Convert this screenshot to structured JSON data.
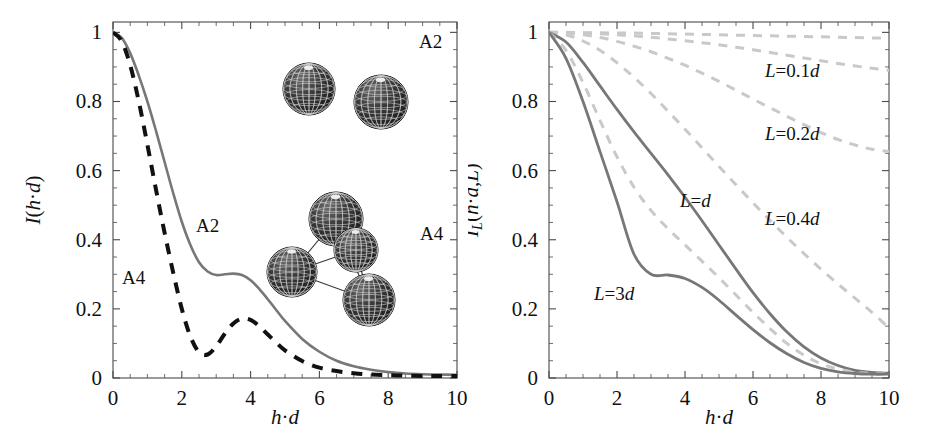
{
  "figure": {
    "background": "#ffffff",
    "panels": [
      {
        "id": "left",
        "axes": {
          "xlabel": "h·d",
          "ylabel": "I(h·d)",
          "ylabel_sub": "",
          "xticks": [
            "0",
            "2",
            "4",
            "6",
            "8",
            "10"
          ],
          "xtick_values": [
            0,
            2,
            4,
            6,
            8,
            10
          ],
          "yticks": [
            "0",
            "0.2",
            "0.4",
            "0.6",
            "0.8",
            "1"
          ],
          "ytick_values": [
            0,
            0.2,
            0.4,
            0.6,
            0.8,
            1
          ],
          "xlim": [
            0,
            10
          ],
          "ylim": [
            0,
            1.03
          ],
          "grid": false,
          "minor_ticks": true
        },
        "annotations": [
          {
            "name": "label-a2-curve",
            "text": "A2",
            "x": 196,
            "y": 232
          },
          {
            "name": "label-a4-curve",
            "text": "A4",
            "x": 122,
            "y": 284
          },
          {
            "name": "label-a2-cluster",
            "text": "A2",
            "x": 419,
            "y": 48
          },
          {
            "name": "label-a4-cluster",
            "text": "A4",
            "x": 420,
            "y": 240
          }
        ],
        "clusters": [
          {
            "name": "cluster-a2-dimer",
            "spheres": [
              [
                309,
                89,
                26
              ],
              [
                381,
                102,
                27
              ]
            ],
            "bonds": []
          },
          {
            "name": "cluster-a4-tetramer",
            "spheres": [
              [
                336,
                219,
                27
              ],
              [
                356,
                250,
                22
              ],
              [
                292,
                272,
                25
              ],
              [
                369,
                300,
                26
              ]
            ],
            "bonds": [
              [
                0,
                1
              ],
              [
                0,
                2
              ],
              [
                1,
                2
              ],
              [
                1,
                3
              ],
              [
                2,
                3
              ],
              [
                0,
                3
              ]
            ]
          }
        ]
      },
      {
        "id": "right",
        "axes": {
          "xlabel": "h·d",
          "ylabel": "I",
          "ylabel_sub": "L",
          "ylabel_rest": "(h·d,L)",
          "xticks": [
            "0",
            "2",
            "4",
            "6",
            "8",
            "10"
          ],
          "xtick_values": [
            0,
            2,
            4,
            6,
            8,
            10
          ],
          "yticks": [
            "0",
            "0.2",
            "0.4",
            "0.6",
            "0.8",
            "1"
          ],
          "ytick_values": [
            0,
            0.2,
            0.4,
            0.6,
            0.8,
            1
          ],
          "xlim": [
            0,
            10
          ],
          "ylim": [
            0,
            1.03
          ],
          "grid": false,
          "minor_ticks": true
        },
        "annotations": [
          {
            "name": "label-L-0p1d",
            "text": "L=0.1d",
            "x": 297,
            "y": 77
          },
          {
            "name": "label-L-0p2d",
            "text": "L=0.2d",
            "x": 297,
            "y": 140
          },
          {
            "name": "label-L-0p4d",
            "text": "L=0.4d",
            "x": 297,
            "y": 225
          },
          {
            "name": "label-L-d",
            "text": "L=d",
            "x": 212,
            "y": 207
          },
          {
            "name": "label-L-3d",
            "text": "L=3d",
            "x": 126,
            "y": 300
          }
        ]
      }
    ]
  },
  "colors": {
    "solid_gray": "#777777",
    "dashed_black": "#111111",
    "dashed_light": "#c9c9c9",
    "axis": "#4a4a4a",
    "text": "#111111",
    "sphere_dark": "#2b2b2b",
    "sphere_mesh": "#d8d8d8"
  },
  "chart_data": [
    {
      "type": "line",
      "panel": "left",
      "title": "",
      "xlabel": "h·d",
      "ylabel": "I(h·d)",
      "xlim": [
        0,
        10
      ],
      "ylim": [
        0,
        1.03
      ],
      "grid": false,
      "legend": "inline-labels",
      "x": [
        0,
        0.25,
        0.5,
        0.75,
        1,
        1.25,
        1.5,
        1.75,
        2,
        2.25,
        2.5,
        2.75,
        3,
        3.25,
        3.5,
        3.75,
        4,
        4.25,
        4.5,
        4.75,
        5,
        5.5,
        6,
        6.5,
        7,
        7.5,
        8,
        8.5,
        9,
        9.5,
        10
      ],
      "series": [
        {
          "name": "A2",
          "style": "solid",
          "color": "#777777",
          "values": [
            1.0,
            0.985,
            0.94,
            0.875,
            0.8,
            0.715,
            0.625,
            0.535,
            0.452,
            0.385,
            0.335,
            0.308,
            0.298,
            0.3,
            0.302,
            0.298,
            0.283,
            0.258,
            0.228,
            0.196,
            0.165,
            0.113,
            0.076,
            0.05,
            0.034,
            0.024,
            0.017,
            0.013,
            0.011,
            0.01,
            0.009
          ]
        },
        {
          "name": "A4",
          "style": "dashed",
          "color": "#111111",
          "values": [
            1.0,
            0.975,
            0.905,
            0.8,
            0.675,
            0.545,
            0.42,
            0.305,
            0.2,
            0.12,
            0.075,
            0.068,
            0.092,
            0.128,
            0.158,
            0.172,
            0.168,
            0.15,
            0.126,
            0.102,
            0.08,
            0.049,
            0.03,
            0.02,
            0.014,
            0.01,
            0.008,
            0.007,
            0.006,
            0.006,
            0.006
          ]
        }
      ]
    },
    {
      "type": "line",
      "panel": "right",
      "title": "",
      "xlabel": "h·d",
      "ylabel": "I_L(h·d,L)",
      "xlim": [
        0,
        10
      ],
      "ylim": [
        0,
        1.03
      ],
      "grid": false,
      "legend": "inline-labels",
      "x": [
        0,
        0.5,
        1,
        1.5,
        2,
        2.5,
        3,
        3.5,
        4,
        4.5,
        5,
        5.5,
        6,
        6.5,
        7,
        7.5,
        8,
        8.5,
        9,
        9.5,
        10
      ],
      "series": [
        {
          "name": "L=0.05d",
          "style": "dashed",
          "color": "#c9c9c9",
          "values": [
            1.0,
            1.0,
            0.999,
            0.999,
            0.998,
            0.998,
            0.997,
            0.996,
            0.995,
            0.994,
            0.993,
            0.992,
            0.991,
            0.99,
            0.989,
            0.988,
            0.987,
            0.986,
            0.985,
            0.984,
            0.983
          ]
        },
        {
          "name": "L=0.1d",
          "style": "dashed",
          "color": "#c9c9c9",
          "values": [
            1.0,
            0.999,
            0.998,
            0.996,
            0.993,
            0.99,
            0.986,
            0.981,
            0.976,
            0.97,
            0.964,
            0.957,
            0.95,
            0.942,
            0.934,
            0.926,
            0.918,
            0.91,
            0.903,
            0.896,
            0.89
          ]
        },
        {
          "name": "L=0.2d",
          "style": "dashed",
          "color": "#c9c9c9",
          "values": [
            1.0,
            0.998,
            0.993,
            0.985,
            0.974,
            0.96,
            0.944,
            0.925,
            0.905,
            0.882,
            0.858,
            0.833,
            0.807,
            0.782,
            0.757,
            0.733,
            0.71,
            0.69,
            0.674,
            0.662,
            0.655
          ]
        },
        {
          "name": "L=0.4d",
          "style": "dashed",
          "color": "#c9c9c9",
          "values": [
            1.0,
            0.993,
            0.975,
            0.948,
            0.912,
            0.87,
            0.823,
            0.772,
            0.72,
            0.666,
            0.612,
            0.559,
            0.507,
            0.456,
            0.407,
            0.36,
            0.315,
            0.272,
            0.231,
            0.19,
            0.145
          ]
        },
        {
          "name": "L=d",
          "style": "solid",
          "color": "#777777",
          "values": [
            1.0,
            0.972,
            0.913,
            0.845,
            0.777,
            0.712,
            0.65,
            0.588,
            0.523,
            0.455,
            0.385,
            0.315,
            0.247,
            0.186,
            0.133,
            0.09,
            0.058,
            0.036,
            0.022,
            0.016,
            0.014
          ]
        },
        {
          "name": "L=2d",
          "style": "dashed",
          "color": "#c9c9c9",
          "values": [
            1.0,
            0.948,
            0.855,
            0.745,
            0.64,
            0.552,
            0.485,
            0.432,
            0.385,
            0.338,
            0.29,
            0.24,
            0.19,
            0.143,
            0.1,
            0.066,
            0.041,
            0.026,
            0.017,
            0.013,
            0.012
          ]
        },
        {
          "name": "L=3d",
          "style": "solid",
          "color": "#777777",
          "values": [
            1.0,
            0.925,
            0.8,
            0.655,
            0.51,
            0.358,
            0.3,
            0.298,
            0.288,
            0.262,
            0.225,
            0.182,
            0.14,
            0.102,
            0.07,
            0.045,
            0.028,
            0.018,
            0.013,
            0.011,
            0.011
          ]
        }
      ]
    }
  ]
}
